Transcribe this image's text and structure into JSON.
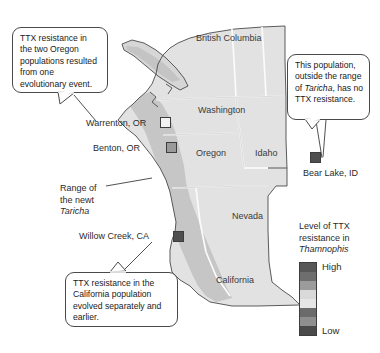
{
  "figure": {
    "background": "#ffffff",
    "map_fill": "#e0e0e0",
    "newt_range_fill": "#c6c6c6",
    "border_color": "#4a4a4a"
  },
  "callouts": [
    {
      "id": "oregon",
      "text": "TTX resistance in the two Oregon populations resulted from one evolutionary event."
    },
    {
      "id": "bearlake",
      "text_before": "This population, outside the range of ",
      "italic": "Taricha",
      "text_after": ", has no TTX resistance."
    },
    {
      "id": "california",
      "text": "TTX resistance in the California population evolved separately and earlier."
    }
  ],
  "regions": [
    {
      "name": "British Columbia"
    },
    {
      "name": "Washington"
    },
    {
      "name": "Oregon"
    },
    {
      "name": "Idaho"
    },
    {
      "name": "Nevada"
    },
    {
      "name": "California"
    }
  ],
  "sites": [
    {
      "name": "Warrenton, OR",
      "swatch": "#f2f2f2",
      "resistance": "low"
    },
    {
      "name": "Benton, OR",
      "swatch": "#9a9a9a",
      "resistance": "medium"
    },
    {
      "name": "Willow Creek, CA",
      "swatch": "#4f4f4f",
      "resistance": "high"
    },
    {
      "name": "Bear Lake, ID",
      "swatch": "#4f4f4f",
      "resistance": "none"
    }
  ],
  "range_label": {
    "line1": "Range of",
    "line2": "the newt",
    "italic": "Taricha"
  },
  "legend": {
    "title_line1": "Level of TTX",
    "title_line2": "resistance in",
    "title_italic": "Thamnophis",
    "high_label": "High",
    "low_label": "Low",
    "swatches": [
      "#575757",
      "#6e6e6e",
      "#9b9b9b",
      "#d9d9d9",
      "#e6e6e6",
      "#6b6b6b",
      "#8f8f8f",
      "#4a4a4a"
    ]
  }
}
